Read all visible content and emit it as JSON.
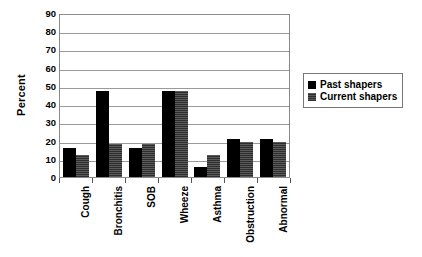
{
  "chart_data": {
    "type": "bar",
    "title": "",
    "xlabel": "",
    "ylabel": "Percent",
    "ylim": [
      0,
      90
    ],
    "ytick_step": 10,
    "yticks": [
      90,
      80,
      70,
      60,
      50,
      40,
      30,
      20,
      10,
      0
    ],
    "grid": true,
    "legend_position": "right",
    "categories": [
      "Cough",
      "Bronchitis",
      "SOB",
      "Wheeze",
      "Asthma",
      "Obstruction",
      "Abnormal"
    ],
    "series": [
      {
        "name": "Past shapers",
        "color": "#000000",
        "values": [
          16,
          47,
          16,
          47,
          5.5,
          21,
          21
        ]
      },
      {
        "name": "Current shapers",
        "color": "#4d4d4d",
        "values": [
          12,
          18,
          18,
          47,
          12,
          19,
          19
        ]
      }
    ]
  },
  "legend": {
    "entries": [
      {
        "label": "Past shapers",
        "swatch": "past-swatch"
      },
      {
        "label": "Current shapers",
        "swatch": "current-swatch"
      }
    ]
  }
}
